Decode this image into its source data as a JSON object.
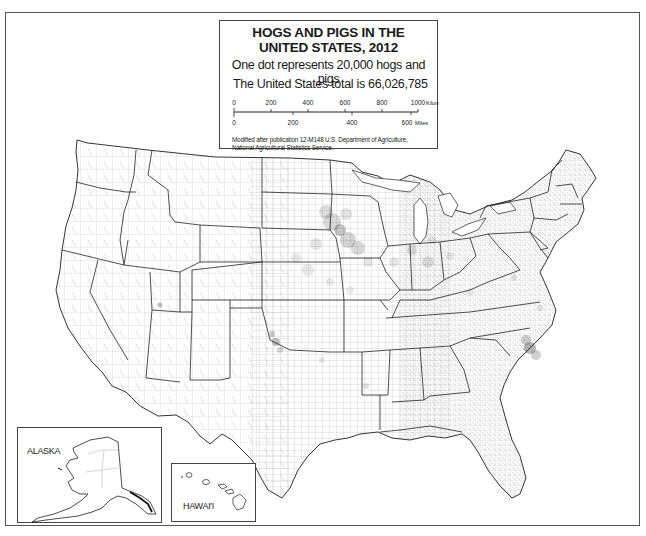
{
  "map": {
    "title_line1": "HOGS AND PIGS IN THE",
    "title_line2": "UNITED STATES, 2012",
    "dot_value_text": "One dot represents 20,000 hogs and pigs",
    "total_text": "The United States total is 66,026,785",
    "scale_bar": {
      "kilometers": {
        "ticks": [
          "0",
          "200",
          "400",
          "600",
          "800",
          "1000"
        ],
        "unit_label": "Kilometers"
      },
      "miles": {
        "ticks": [
          "0",
          "200",
          "400",
          "600"
        ],
        "unit_label": "Miles"
      }
    },
    "credit_line1": "Modified after publication 12-M148 U.S. Department of Agriculture,",
    "credit_line2": "National Agricultural Statistics Service.",
    "insets": {
      "alaska_label": "ALASKA",
      "hawaii_label": "HAWAI'I"
    },
    "symbology": {
      "dot_color": "#2a2a2a",
      "state_border_color": "#222222",
      "county_border_color": "#9a9a9a",
      "dot_unit": 20000,
      "total": 66026785
    },
    "high_density_regions": [
      "Iowa",
      "Southern Minnesota",
      "North Carolina",
      "Oklahoma Panhandle",
      "Indiana",
      "Illinois",
      "Nebraska"
    ]
  }
}
